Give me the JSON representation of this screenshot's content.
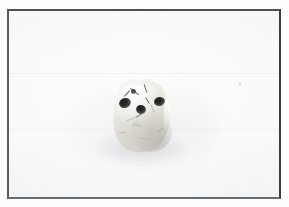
{
  "image": {
    "domain": "natural-image",
    "kind": "photograph",
    "caption": "Small pale irregular specimen on a white studio backdrop",
    "width": 289,
    "height": 207,
    "orientation": "landscape"
  },
  "frame": {
    "name": "photograph-frame",
    "style": "thin dark rectangular border with white outer margin",
    "border_color_top": "#4d4f50",
    "border_color_left": "#5a5c5d",
    "border_color_right": "#3b3d3e",
    "border_color_bottom": "#6a6c6d",
    "border_width_px": 2,
    "outer_margin_color": "#fdfdfd",
    "outer_margin_left_px": 7,
    "outer_margin_top_px": 9,
    "inner_width_px": 274,
    "inner_height_px": 190
  },
  "background": {
    "name": "studio-backdrop",
    "description": "Evenly lit near-white seamless backdrop with faint horizontal seams and paper grain",
    "base_color": "#fafafb",
    "highlight_color": "#fdfdfd",
    "edge_color": "#eff0f1",
    "seam_y_px": [
      62,
      118
    ],
    "grain": "very fine",
    "specks": [
      {
        "name": "dust-speck",
        "x": 230,
        "y": 71,
        "color": "#8c9094"
      }
    ]
  },
  "subject": {
    "name": "specimen",
    "label": "Pale cuboid specimen",
    "description": "Roughly square to trapezoidal pale-cream object with a rough mottled surface, a bright specular rim on the upper-left and a bright vertical glint on the right flank",
    "bbox": {
      "x": 99,
      "y": 67,
      "width": 66,
      "height": 76
    },
    "center": {
      "x": 132,
      "y": 105
    },
    "body_colors": {
      "lightest": "#f7f6f3",
      "mid": "#e6e3dd",
      "shadowed": "#cac6bf",
      "texture_mottle": "#8c8880"
    },
    "surface": "rough, mottled, with hairline fissures and striations",
    "highlights": [
      {
        "name": "rim-highlight",
        "position": "upper-left edge",
        "color": "#ffffff"
      },
      {
        "name": "edge-glint",
        "position": "right flank, vertical",
        "color": "#ffffff"
      }
    ],
    "shading": [
      {
        "name": "body-shade",
        "position": "lower-right",
        "color": "#827e78"
      }
    ],
    "pits": [
      {
        "name": "pit-left",
        "x": 110,
        "y": 87,
        "width": 12,
        "height": 10,
        "color": "#1d1c1b"
      },
      {
        "name": "pit-center",
        "x": 127,
        "y": 94,
        "width": 10,
        "height": 9,
        "color": "#1d1c1b"
      },
      {
        "name": "pit-right",
        "x": 145,
        "y": 86,
        "width": 11,
        "height": 9,
        "color": "#1d1c1b"
      },
      {
        "name": "pit-small-top",
        "x": 122,
        "y": 78,
        "width": 5,
        "height": 5,
        "color": "#2d2b29"
      }
    ],
    "pit_count": 4,
    "fissure_count": 6,
    "crack_count": 5
  },
  "shadow": {
    "name": "cast-shadow",
    "description": "Soft diffuse contact shadow directly beneath the specimen",
    "bbox": {
      "x": 86,
      "y": 122,
      "width": 92,
      "height": 30
    },
    "color": "#787c80",
    "softness": "very soft"
  },
  "ambient": {
    "name": "ambient-shade",
    "description": "Very faint broad shading around and to the left of the specimen",
    "bbox": {
      "x": 60,
      "y": 72,
      "width": 150,
      "height": 90
    },
    "color": "#969a9e"
  }
}
